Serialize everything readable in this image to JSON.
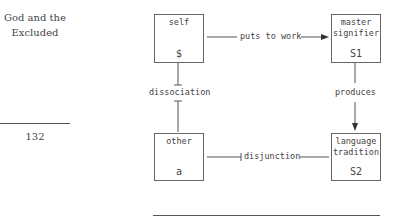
{
  "margin": {
    "running_head_line1": "God and the",
    "running_head_line2": "Excluded",
    "page_number": "132"
  },
  "diagram": {
    "nodes": {
      "self": {
        "label": "self",
        "symbol": "$"
      },
      "master_signifier": {
        "label_line1": "master",
        "label_line2": "signifier",
        "symbol": "S1"
      },
      "other": {
        "label": "other",
        "symbol": "a"
      },
      "language_tradition": {
        "label_line1": "language",
        "label_line2": "tradition",
        "symbol": "S2"
      }
    },
    "edges": {
      "top": {
        "label": "puts to work",
        "from": "self",
        "to": "master signifier",
        "style": "arrow"
      },
      "right": {
        "label": "produces",
        "from": "master signifier",
        "to": "language tradition",
        "style": "arrow"
      },
      "left": {
        "label": "dissociation",
        "between": [
          "self",
          "other"
        ],
        "style": "blocked"
      },
      "bottom": {
        "label": "disjunction",
        "between": [
          "other",
          "language tradition"
        ],
        "style": "blocked"
      }
    }
  }
}
